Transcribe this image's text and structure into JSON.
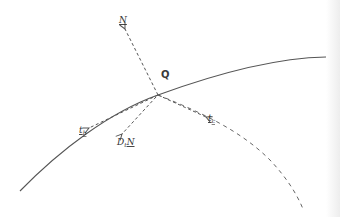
{
  "diagram": {
    "labels": {
      "point": "Q",
      "normal": "N",
      "tangent_c": "t",
      "tangent_c_sub": "c",
      "tangent_b": "t",
      "tangent_b_sub": "b",
      "derivative_d": "D",
      "derivative_sub": "t",
      "derivative_n": "N"
    },
    "elements": [
      {
        "name": "surface-curve",
        "style": "solid"
      },
      {
        "name": "geodesic-curve",
        "style": "dashed"
      },
      {
        "name": "normal-vector-N",
        "style": "dashed-arrow"
      },
      {
        "name": "tangent-vector-tc",
        "style": "dashed-arrow"
      },
      {
        "name": "tangent-vector-tb",
        "style": "dashed-arrow"
      },
      {
        "name": "derivative-vector-DtN",
        "style": "dashed-arrow"
      }
    ],
    "colors": {
      "line": "#555555",
      "text": "#333333",
      "background": "#ffffff"
    }
  }
}
